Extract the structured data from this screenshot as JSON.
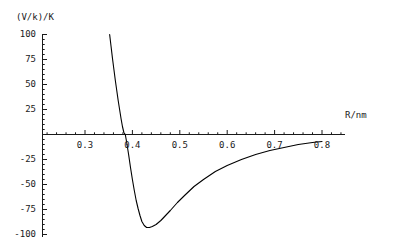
{
  "chart_data": {
    "type": "line",
    "title": "",
    "subtitle": "",
    "xlabel": "R/nm",
    "ylabel": "(V/k)/K",
    "xlim": [
      0.25,
      0.82
    ],
    "ylim": [
      -100,
      100
    ],
    "grid": false,
    "legend": null,
    "xticks": [
      0.3,
      0.4,
      0.5,
      0.6,
      0.7,
      0.8
    ],
    "xtick_labels": [
      "0.3",
      "0.4",
      "0.5",
      "0.6",
      "0.7",
      "0.8"
    ],
    "yticks": [
      -100,
      -75,
      -50,
      -25,
      0,
      25,
      50,
      75,
      100
    ],
    "ytick_labels": [
      "-100",
      "-75",
      "-50",
      "-25",
      "",
      "25",
      "50",
      "75",
      "100"
    ],
    "minor_tick_count_per_interval": 5,
    "annotations": [],
    "series": [
      {
        "name": "Lennard-Jones potential",
        "color": "#000000",
        "zero_crossing_x": 0.385,
        "minimum_x": 0.42,
        "minimum_y": -93,
        "x": [
          0.352,
          0.355,
          0.358,
          0.361,
          0.364,
          0.367,
          0.37,
          0.373,
          0.376,
          0.379,
          0.382,
          0.385,
          0.388,
          0.392,
          0.396,
          0.4,
          0.404,
          0.408,
          0.412,
          0.416,
          0.42,
          0.425,
          0.43,
          0.436,
          0.442,
          0.45,
          0.46,
          0.47,
          0.48,
          0.495,
          0.51,
          0.53,
          0.55,
          0.575,
          0.6,
          0.63,
          0.66,
          0.69,
          0.72,
          0.75,
          0.78,
          0.8
        ],
        "y": [
          100,
          88,
          76,
          65,
          54,
          44,
          34,
          25,
          16,
          8,
          2,
          0,
          -8,
          -20,
          -33,
          -45,
          -56,
          -66,
          -74,
          -81,
          -87,
          -91,
          -93,
          -93,
          -92,
          -90,
          -86,
          -81,
          -76,
          -68,
          -61,
          -52,
          -45,
          -37,
          -31,
          -25,
          -20,
          -16,
          -13,
          -10,
          -8,
          -7
        ]
      }
    ]
  },
  "axis_titles": {
    "y": "(V/k)/K",
    "x": "R/nm"
  }
}
